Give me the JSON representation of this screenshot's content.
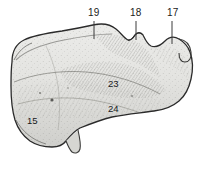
{
  "figure": {
    "background_color": "#ffffff",
    "ink_color": "#2b2b2b",
    "bone_fill_light": "#e8e8e6",
    "bone_fill_mid": "#cfcfcb",
    "bone_fill_dark": "#a9a9a5",
    "width": 202,
    "height": 169
  },
  "callouts": [
    {
      "id": "19",
      "label": "19",
      "text_x": 88,
      "text_y": 8,
      "line_x1": 94,
      "line_y1": 21,
      "line_x2": 94,
      "line_y2": 39
    },
    {
      "id": "18",
      "label": "18",
      "text_x": 130,
      "text_y": 8,
      "line_x1": 136,
      "line_y1": 21,
      "line_x2": 136,
      "line_y2": 40
    },
    {
      "id": "17",
      "label": "17",
      "text_x": 167,
      "text_y": 8,
      "line_x1": 172,
      "line_y1": 21,
      "line_x2": 172,
      "line_y2": 44
    }
  ],
  "surface_labels": [
    {
      "id": "23",
      "label": "23",
      "x": 108,
      "y": 79
    },
    {
      "id": "24",
      "label": "24",
      "x": 108,
      "y": 104
    },
    {
      "id": "15",
      "label": "15",
      "x": 27,
      "y": 116
    }
  ]
}
